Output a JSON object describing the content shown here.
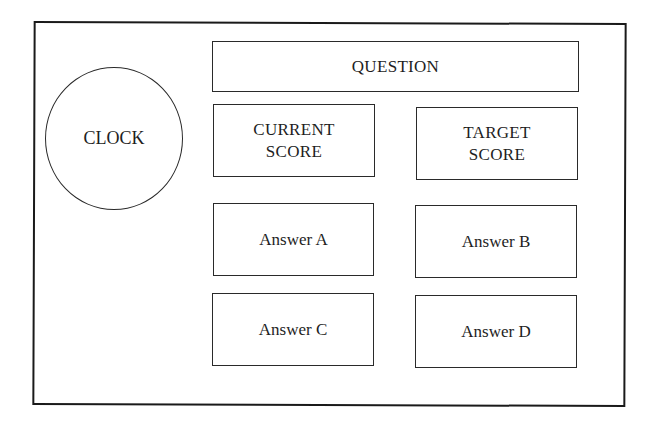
{
  "diagram": {
    "type": "ui-wireframe",
    "clock": {
      "label": "CLOCK"
    },
    "question": {
      "label": "QUESTION"
    },
    "current_score": {
      "line1": "CURRENT",
      "line2": "SCORE"
    },
    "target_score": {
      "line1": "TARGET",
      "line2": "SCORE"
    },
    "answers": [
      {
        "label": "Answer A"
      },
      {
        "label": "Answer B"
      },
      {
        "label": "Answer C"
      },
      {
        "label": "Answer D"
      }
    ],
    "colors": {
      "stroke": "#1a1a1a",
      "background": "#ffffff",
      "text": "#1e1e1e"
    }
  }
}
